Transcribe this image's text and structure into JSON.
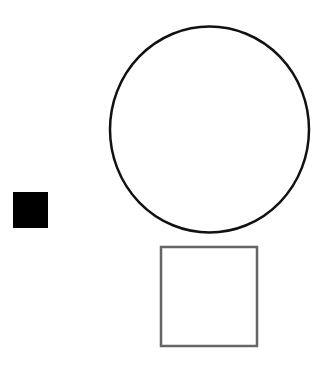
{
  "canvas": {
    "width": 328,
    "height": 371,
    "background": "#ffffff"
  },
  "shapes": {
    "circle": {
      "cx": 209.5,
      "cy": 129.5,
      "rx": 99.5,
      "ry": 103,
      "stroke": "#111111",
      "stroke_width": 2.5,
      "fill": "none"
    },
    "black_square": {
      "x": 13,
      "y": 192,
      "width": 35,
      "height": 36,
      "fill": "#000000"
    },
    "grey_square": {
      "x": 161,
      "y": 247,
      "width": 96,
      "height": 99,
      "stroke": "#666666",
      "stroke_width": 2.5,
      "fill": "none"
    }
  }
}
